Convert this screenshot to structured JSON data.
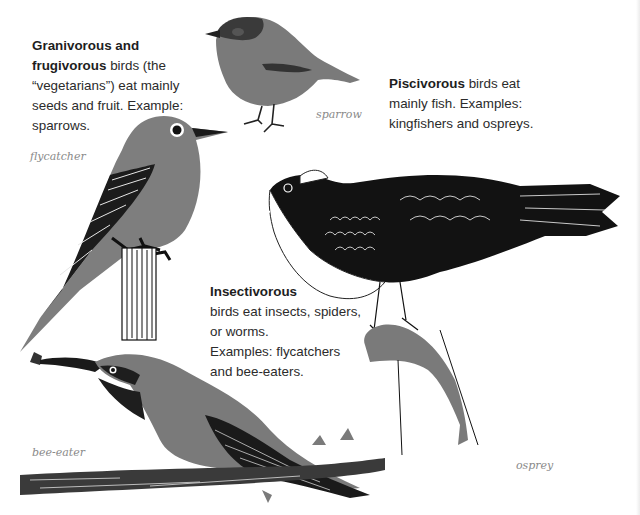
{
  "blocks": {
    "granivorous": {
      "bold": "Granivorous and frugivorous",
      "line1_bold": "Granivorous and",
      "line2_bold": "frugivorous",
      "line2_rest": " birds (the",
      "line3": "“vegetarians”) eat mainly",
      "line4": "seeds and fruit. Example:",
      "line5": "sparrows."
    },
    "piscivorous": {
      "bold": "Piscivorous",
      "line1_rest": " birds eat",
      "line2": "mainly fish. Examples:",
      "line3": "kingfishers and ospreys."
    },
    "insectivorous": {
      "bold": "Insectivorous",
      "line2": "birds eat insects, spiders,",
      "line3": "or worms.",
      "line4": "Examples: flycatchers",
      "line5": "and bee-eaters."
    }
  },
  "captions": {
    "sparrow": "sparrow",
    "flycatcher": "flycatcher",
    "bee_eater": "bee-eater",
    "osprey": "osprey"
  },
  "colors": {
    "bird_gray": "#7a7a7a",
    "ink": "#1a1a1a",
    "text": "#2b2b2b",
    "caption": "#8a8a8a"
  }
}
